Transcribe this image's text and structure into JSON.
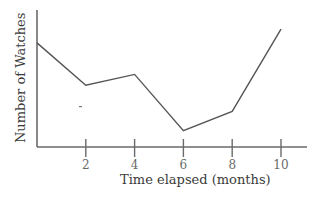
{
  "chart_data": {
    "type": "line",
    "title": "",
    "xlabel": "Time elapsed (months)",
    "ylabel": "Number of Watches",
    "x": [
      0,
      2,
      4,
      6,
      8,
      10
    ],
    "x_ticks": [
      "2",
      "4",
      "6",
      "8",
      "10"
    ],
    "series": [
      {
        "name": "Number of Watches",
        "values_relative": [
          0.76,
          0.45,
          0.53,
          0.12,
          0.26,
          0.86
        ],
        "color": "#555555"
      }
    ],
    "y_ticks": [],
    "xlim": [
      0,
      11
    ],
    "grid": false,
    "legend": null
  }
}
